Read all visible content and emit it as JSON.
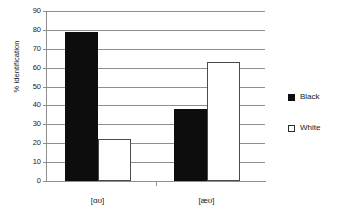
{
  "chart_data": {
    "type": "bar",
    "title": "",
    "xlabel": "",
    "ylabel": "% identification",
    "categories": [
      "[ɑʊ]",
      "[æʊ]"
    ],
    "series": [
      {
        "name": "Black",
        "color": "#0d0d0d",
        "values": [
          79,
          38
        ]
      },
      {
        "name": "White",
        "color": "#ffffff",
        "values": [
          22,
          63
        ]
      }
    ],
    "ylim": [
      0,
      90
    ],
    "ytick_step": 10,
    "yticks": [
      0,
      10,
      20,
      30,
      40,
      50,
      60,
      70,
      80,
      90
    ],
    "ytick_labels": [
      "0",
      "10",
      "20",
      "30",
      "40",
      "50",
      "60",
      "70",
      "80",
      "90"
    ],
    "grid": true,
    "grid_axis": "y",
    "legend_position": "right",
    "legend": [
      {
        "label": "Black",
        "swatch": "filled-black-square"
      },
      {
        "label": "White",
        "swatch": "outlined-white-square"
      }
    ],
    "axis_color": "#8e8e8e",
    "text_color": "#1a1a1a",
    "background": "#ffffff"
  }
}
